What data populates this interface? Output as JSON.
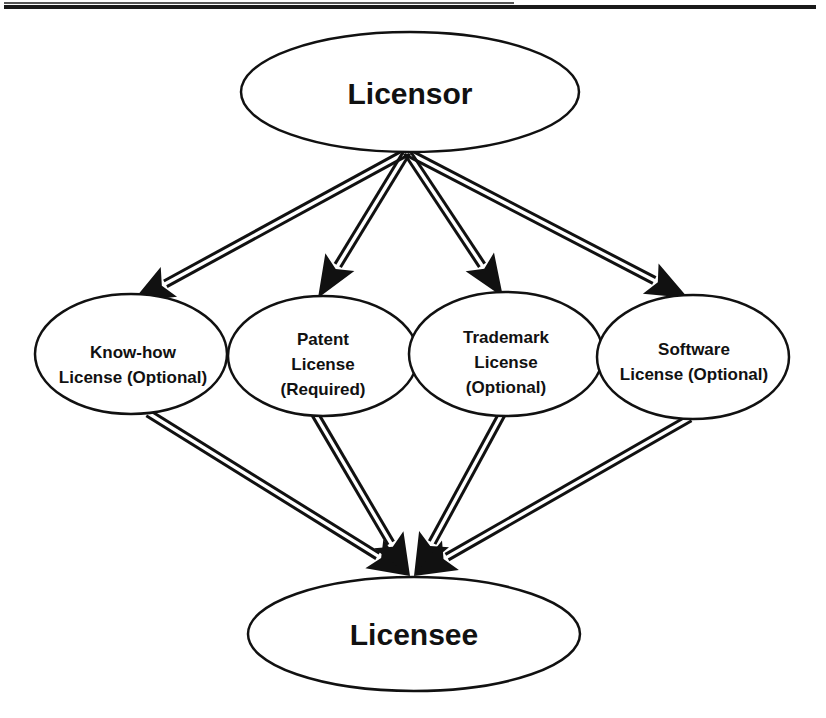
{
  "diagram": {
    "type": "licensing-flow",
    "source_node": {
      "id": "licensor",
      "label": "Licensor"
    },
    "target_node": {
      "id": "licensee",
      "label": "Licensee"
    },
    "intermediate_nodes": [
      {
        "id": "knowhow",
        "lines": [
          "Know-how",
          "License (Optional)"
        ]
      },
      {
        "id": "patent",
        "lines": [
          "Patent",
          "License",
          "(Required)"
        ]
      },
      {
        "id": "trademark",
        "lines": [
          "Trademark",
          "License",
          "(Optional)"
        ]
      },
      {
        "id": "software",
        "lines": [
          "Software",
          "License (Optional)"
        ]
      }
    ],
    "edges": [
      {
        "from": "licensor",
        "to": "knowhow"
      },
      {
        "from": "licensor",
        "to": "patent"
      },
      {
        "from": "licensor",
        "to": "trademark"
      },
      {
        "from": "licensor",
        "to": "software"
      },
      {
        "from": "knowhow",
        "to": "licensee"
      },
      {
        "from": "patent",
        "to": "licensee"
      },
      {
        "from": "trademark",
        "to": "licensee"
      },
      {
        "from": "software",
        "to": "licensee"
      }
    ],
    "colors": {
      "stroke": "#111111",
      "fill": "#ffffff"
    }
  }
}
